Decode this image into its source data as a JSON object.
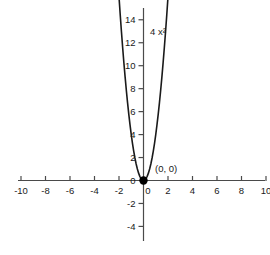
{
  "chart_data": {
    "type": "line",
    "title": "",
    "subtitle": "",
    "xlabel": "",
    "ylabel": "",
    "equation_label": "4 x²",
    "function": "y = 4x^2",
    "coefficient": 4,
    "xlim": [
      -10.4,
      10.4
    ],
    "ylim": [
      -5.2,
      15.4
    ],
    "grid": false,
    "legend_position": "none",
    "x_ticks": [
      "-10",
      "-8",
      "-6",
      "-4",
      "-2",
      "0",
      "2",
      "4",
      "6",
      "8",
      "10"
    ],
    "x_tick_values": [
      -10,
      -8,
      -6,
      -4,
      -2,
      0,
      2,
      4,
      6,
      8,
      10
    ],
    "y_ticks": [
      "14",
      "12",
      "10",
      "8",
      "6",
      "4",
      "2",
      "0",
      "-2",
      "-4"
    ],
    "y_tick_values": [
      14,
      12,
      10,
      8,
      6,
      4,
      2,
      0,
      -2,
      -4
    ],
    "series": [
      {
        "name": "4 x²",
        "x": [
          -2.0,
          -1.9,
          -1.8,
          -1.7,
          -1.6,
          -1.5,
          -1.4,
          -1.3,
          -1.2,
          -1.1,
          -1.0,
          -0.9,
          -0.8,
          -0.7,
          -0.6,
          -0.5,
          -0.4,
          -0.3,
          -0.2,
          -0.1,
          0.0,
          0.1,
          0.2,
          0.3,
          0.4,
          0.5,
          0.6,
          0.7,
          0.8,
          0.9,
          1.0,
          1.1,
          1.2,
          1.3,
          1.4,
          1.5,
          1.6,
          1.7,
          1.8,
          1.9,
          2.0
        ],
        "y": [
          16.0,
          14.44,
          12.96,
          11.56,
          10.24,
          9.0,
          7.84,
          6.76,
          5.76,
          4.84,
          4.0,
          3.24,
          2.56,
          1.96,
          1.44,
          1.0,
          0.64,
          0.36,
          0.16,
          0.04,
          0.0,
          0.04,
          0.16,
          0.36,
          0.64,
          1.0,
          1.44,
          1.96,
          2.56,
          3.24,
          4.0,
          4.84,
          5.76,
          6.76,
          7.84,
          9.0,
          10.24,
          11.56,
          12.96,
          14.44,
          16.0
        ]
      }
    ],
    "annotations": [
      {
        "name": "vertex-point",
        "label": "(0, 0)",
        "x": 0,
        "y": 0,
        "marker": "filled-circle"
      },
      {
        "name": "curve-equation",
        "label": "4 x²",
        "x": 0.6,
        "y": 13.2
      }
    ],
    "colors": {
      "curve": "#1a1a1a",
      "axis": "#4a4a4a",
      "text": "#1a1a1a",
      "background": "#ffffff",
      "marker": "#000000"
    }
  },
  "artifact": {
    "name": "scan-artifact",
    "description": "faint partial glyph at top-left edge"
  }
}
